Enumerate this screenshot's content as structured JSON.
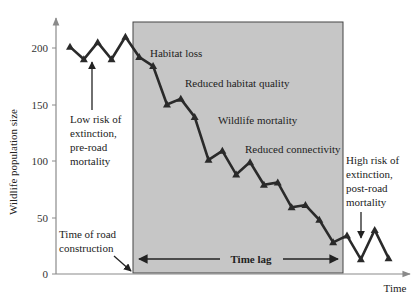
{
  "chart_data": {
    "type": "line",
    "title": "",
    "xlabel": "Time",
    "ylabel": "Wildlife population size",
    "ylim": [
      0,
      220
    ],
    "yticks": [
      0,
      50,
      100,
      150,
      200
    ],
    "grid": false,
    "legend": null,
    "series": [
      {
        "name": "Wildlife population",
        "marker": "triangle",
        "x": [
          1,
          2,
          3,
          4,
          5,
          6,
          7,
          8,
          9,
          10,
          11,
          12,
          13,
          14,
          15,
          16,
          17,
          18,
          19,
          20,
          21,
          22,
          23,
          24
        ],
        "values": [
          201,
          190,
          205,
          190,
          210,
          192,
          184,
          150,
          155,
          139,
          101,
          109,
          88,
          99,
          79,
          81,
          59,
          61,
          48,
          28,
          34,
          13,
          39,
          14
        ]
      }
    ],
    "shaded_region": {
      "label": "Time lag",
      "x_start": 5,
      "x_end": 20,
      "color": "#c8c8c8"
    },
    "annotations": [
      {
        "text": "Habitat loss",
        "position": "inside-shaded-top"
      },
      {
        "text": "Reduced habitat quality",
        "position": "inside-shaded"
      },
      {
        "text": "Wildlife mortality",
        "position": "inside-shaded"
      },
      {
        "text": "Reduced connectivity",
        "position": "inside-shaded"
      },
      {
        "text": "Low risk of extinction, pre-road mortality",
        "position": "left-region",
        "arrow": "up"
      },
      {
        "text": "High risk of extinction, post-road mortality",
        "position": "right-region",
        "arrow": "down"
      },
      {
        "text": "Time of road construction",
        "position": "bottom-left",
        "arrow": "to-shaded-start"
      },
      {
        "text": "Time lag",
        "position": "bottom-shaded",
        "arrow": "double-horizontal"
      }
    ]
  },
  "labels": {
    "ylabel": "Wildlife population size",
    "xlabel": "Time",
    "yticks": [
      "0",
      "50",
      "100",
      "150",
      "200"
    ],
    "habitat_loss": "Habitat loss",
    "reduced_quality": "Reduced habitat quality",
    "wildlife_mortality": "Wildlife mortality",
    "reduced_connectivity": "Reduced connectivity",
    "low_risk": [
      "Low risk of",
      "extinction,",
      "pre-road",
      "mortality"
    ],
    "high_risk": [
      "High risk of",
      "extinction,",
      "post-road",
      "mortality"
    ],
    "road_construction": [
      "Time of road",
      "construction"
    ],
    "time_lag": "Time lag"
  },
  "colors": {
    "shade": "#c6c6c6",
    "line": "#2a2a2a",
    "axis": "#8a8a8a"
  }
}
